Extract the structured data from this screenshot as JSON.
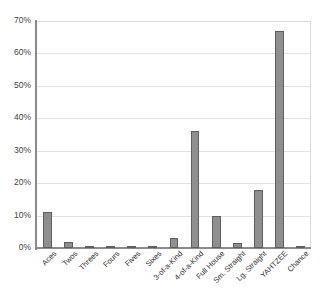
{
  "chart_data": {
    "type": "bar",
    "title": "",
    "subtitle": "",
    "xlabel": "",
    "ylabel": "",
    "ylim": [
      0,
      70
    ],
    "y_unit": "%",
    "grid": true,
    "legend": "none",
    "yticks": [
      "0%",
      "10%",
      "20%",
      "30%",
      "40%",
      "50%",
      "60%",
      "70%"
    ],
    "ytick_values": [
      0,
      10,
      20,
      30,
      40,
      50,
      60,
      70
    ],
    "categories": [
      "Aces",
      "Twos",
      "Threes",
      "Fours",
      "Fives",
      "Sixes",
      "3-of-a-Kind",
      "4-of-a-Kind",
      "Full House",
      "Sm. Straight",
      "Lg. Straight",
      "YAHTZEE",
      "Chance"
    ],
    "values": [
      11,
      1.8,
      0.7,
      0.6,
      0.4,
      0.6,
      3,
      36,
      10,
      1.5,
      18,
      67,
      0.5
    ],
    "series": [
      {
        "name": "Percent",
        "values": [
          11,
          1.8,
          0.7,
          0.6,
          0.4,
          0.6,
          3,
          36,
          10,
          1.5,
          18,
          67,
          0.5
        ]
      }
    ],
    "colors": {
      "bar_fill": "#8f8f8f",
      "bar_border": "#5e5e5e",
      "gridline": "#e3e3e3",
      "axis": "#8a8a8a",
      "text": "#2e2e2e",
      "background": "#ffffff"
    }
  }
}
